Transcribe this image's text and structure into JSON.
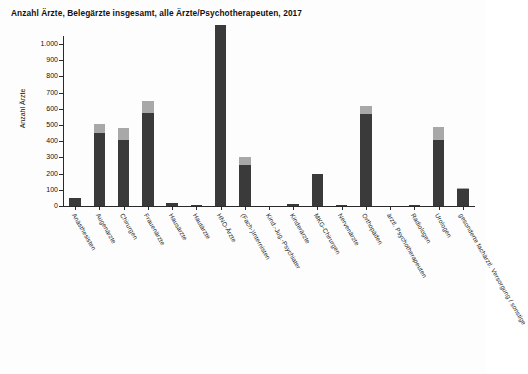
{
  "chart_data": {
    "type": "bar",
    "stacked": true,
    "title": "Anzahl Ärzte, Belegärzte insgesamt, alle Ärzte/Psychotherapeuten, 2017",
    "xlabel": "",
    "ylabel": "Anzahl Ärzte",
    "ylim": [
      0,
      1100
    ],
    "ytick_values": [
      0,
      100,
      200,
      300,
      400,
      500,
      600,
      700,
      800,
      900,
      1000
    ],
    "ytick_labels": [
      "0",
      "100",
      "200",
      "300",
      "400",
      "500",
      "600",
      "700",
      "800",
      "900",
      "1.000"
    ],
    "grid": false,
    "legend": "none",
    "categories": [
      "Anästhesisten",
      "Augenärzte",
      "Chirurgen",
      "Frauenärzte",
      "Hausärzte",
      "Hautärzte",
      "HNO-Ärzte",
      "(Fach-)Internisten",
      "Kind.-Jug.-Psychiater",
      "Kinderärzte",
      "MKG-Chirurgen",
      "Nervenärzte",
      "Orthopäden",
      "ärztl. Psychotherapeuten",
      "Radiologen",
      "Urologen",
      "gesonderte fachärztl. Versorgung / sonstige"
    ],
    "series": [
      {
        "name": "Belegärzte",
        "color": "#3a3a3a",
        "values": [
          50,
          450,
          405,
          575,
          20,
          5,
          1115,
          255,
          0,
          15,
          200,
          5,
          565,
          0,
          5,
          405,
          105
        ]
      },
      {
        "name": "weitere Ärzte",
        "color": "#a8a8a8",
        "values": [
          0,
          55,
          75,
          75,
          0,
          0,
          0,
          50,
          0,
          0,
          0,
          0,
          55,
          0,
          0,
          80,
          5
        ]
      }
    ],
    "totals": [
      50,
      505,
      480,
      650,
      20,
      5,
      1115,
      305,
      0,
      15,
      200,
      5,
      620,
      0,
      5,
      485,
      110
    ]
  }
}
